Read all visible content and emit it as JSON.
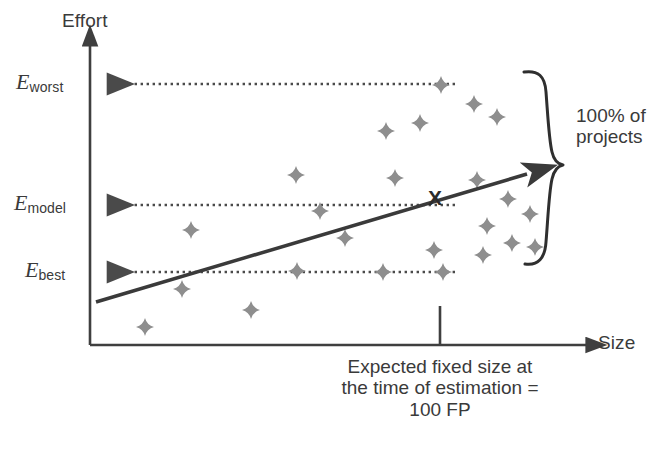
{
  "figure": {
    "colors": {
      "axis": "#3f3f3f",
      "text": "#3a3a3a",
      "trend_line": "#3a3a3a",
      "scatter_point": "#8e8e8e",
      "dotted_arrow": "#4a4a4a",
      "brace": "#2f2f2f",
      "x_marker": "#2b2b2b",
      "background": "#ffffff"
    }
  },
  "axes": {
    "y_label": "Effort",
    "x_label": "Size",
    "y_ticks": [
      {
        "id": "worst",
        "symbol": "E",
        "subscript": "worst",
        "y": 84
      },
      {
        "id": "model",
        "symbol": "E",
        "subscript": "model",
        "y": 205
      },
      {
        "id": "best",
        "symbol": "E",
        "subscript": "best",
        "y": 272
      }
    ],
    "x_tick": {
      "label": "100 FP",
      "x": 440
    }
  },
  "annotations": {
    "brace_label_line1": "100% of",
    "brace_label_line2": "projects",
    "caption_line1": "Expected fixed size at",
    "caption_line2": "the time of estimation =",
    "caption_line3": "100 FP",
    "estimate_marker": "X"
  },
  "chart_data": {
    "type": "scatter",
    "xlabel": "Size",
    "ylabel": "Effort",
    "grid": false,
    "legend": null,
    "xlim": [
      90,
      600
    ],
    "ylim": [
      345,
      30
    ],
    "points": [
      {
        "x": 441,
        "y": 85
      },
      {
        "x": 474,
        "y": 104
      },
      {
        "x": 420,
        "y": 123
      },
      {
        "x": 497,
        "y": 117
      },
      {
        "x": 386,
        "y": 131
      },
      {
        "x": 296,
        "y": 175
      },
      {
        "x": 395,
        "y": 178
      },
      {
        "x": 477,
        "y": 180
      },
      {
        "x": 320,
        "y": 211
      },
      {
        "x": 508,
        "y": 199
      },
      {
        "x": 530,
        "y": 214
      },
      {
        "x": 191,
        "y": 230
      },
      {
        "x": 345,
        "y": 238
      },
      {
        "x": 487,
        "y": 226
      },
      {
        "x": 434,
        "y": 250
      },
      {
        "x": 297,
        "y": 271
      },
      {
        "x": 383,
        "y": 272
      },
      {
        "x": 443,
        "y": 272
      },
      {
        "x": 512,
        "y": 243
      },
      {
        "x": 483,
        "y": 255
      },
      {
        "x": 182,
        "y": 289
      },
      {
        "x": 251,
        "y": 310
      },
      {
        "x": 145,
        "y": 327
      },
      {
        "x": 535,
        "y": 247
      }
    ],
    "trend_line": {
      "x1": 96,
      "y1": 302,
      "x2": 534,
      "y2": 172
    },
    "estimate_point": {
      "x": 435,
      "y": 198,
      "label": "X"
    },
    "reference_lines": [
      {
        "id": "worst",
        "y": 84,
        "from_x": 455,
        "to_x": 104,
        "style": "dotted",
        "arrow": "left"
      },
      {
        "id": "model",
        "y": 205,
        "from_x": 455,
        "to_x": 104,
        "style": "dotted",
        "arrow": "left"
      },
      {
        "id": "best",
        "y": 272,
        "from_x": 455,
        "to_x": 104,
        "style": "dotted",
        "arrow": "left"
      }
    ]
  }
}
